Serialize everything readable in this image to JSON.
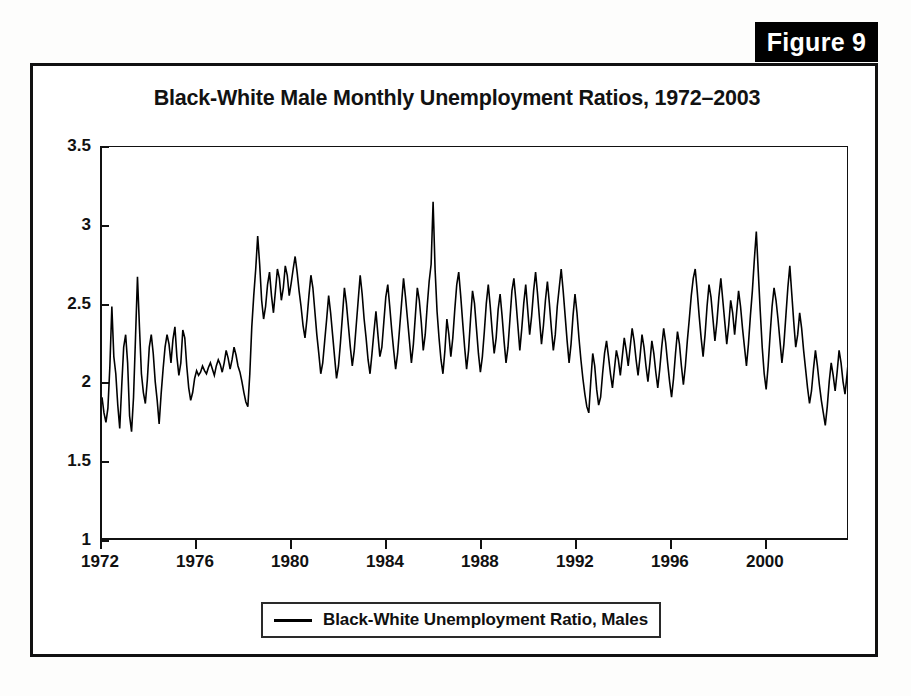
{
  "figure": {
    "tab_label": "Figure 9"
  },
  "chart_data": {
    "type": "line",
    "title": "Black-White Male Monthly Unemployment Ratios, 1972–2003",
    "xlabel": "",
    "ylabel": "",
    "xlim": [
      1972.0,
      2003.5
    ],
    "ylim": [
      1,
      3.5
    ],
    "grid": false,
    "legend_position": "below-plot",
    "y_ticks": [
      1,
      1.5,
      2,
      2.5,
      3,
      3.5
    ],
    "y_tick_labels": [
      "1",
      "1.5",
      "2",
      "2.5",
      "3",
      "3.5"
    ],
    "x_ticks": [
      1972,
      1976,
      1980,
      1984,
      1988,
      1992,
      1996,
      2000
    ],
    "x_tick_labels": [
      "1972",
      "1976",
      "1980",
      "1984",
      "1988",
      "1992",
      "1996",
      "2000"
    ],
    "series": [
      {
        "name": "Black-White Unemployment Ratio, Males",
        "color": "#000000",
        "x_start": 1972.0,
        "x_step": 0.08333,
        "values": [
          1.9,
          1.8,
          1.74,
          1.83,
          2.1,
          2.48,
          2.16,
          2.05,
          1.85,
          1.7,
          1.97,
          2.22,
          2.3,
          2.12,
          1.78,
          1.68,
          1.9,
          2.28,
          2.67,
          2.35,
          2.05,
          1.93,
          1.86,
          2.01,
          2.22,
          2.3,
          2.18,
          2.0,
          1.88,
          1.73,
          1.92,
          2.08,
          2.22,
          2.3,
          2.24,
          2.12,
          2.27,
          2.35,
          2.16,
          2.04,
          2.12,
          2.33,
          2.28,
          2.1,
          1.96,
          1.88,
          1.93,
          2.02,
          2.07,
          2.04,
          2.06,
          2.1,
          2.07,
          2.05,
          2.09,
          2.12,
          2.08,
          2.04,
          2.1,
          2.14,
          2.11,
          2.06,
          2.12,
          2.2,
          2.15,
          2.08,
          2.14,
          2.22,
          2.17,
          2.1,
          2.06,
          2.0,
          1.93,
          1.87,
          1.84,
          2.05,
          2.35,
          2.55,
          2.72,
          2.93,
          2.75,
          2.52,
          2.4,
          2.48,
          2.62,
          2.7,
          2.55,
          2.44,
          2.58,
          2.72,
          2.66,
          2.52,
          2.6,
          2.74,
          2.68,
          2.55,
          2.63,
          2.72,
          2.8,
          2.7,
          2.58,
          2.48,
          2.36,
          2.28,
          2.4,
          2.55,
          2.68,
          2.6,
          2.45,
          2.3,
          2.18,
          2.05,
          2.12,
          2.26,
          2.4,
          2.55,
          2.44,
          2.3,
          2.16,
          2.02,
          2.1,
          2.25,
          2.42,
          2.6,
          2.5,
          2.36,
          2.22,
          2.1,
          2.2,
          2.36,
          2.52,
          2.68,
          2.56,
          2.4,
          2.28,
          2.14,
          2.05,
          2.18,
          2.32,
          2.45,
          2.3,
          2.16,
          2.22,
          2.38,
          2.54,
          2.62,
          2.48,
          2.33,
          2.2,
          2.08,
          2.18,
          2.34,
          2.5,
          2.66,
          2.54,
          2.4,
          2.26,
          2.12,
          2.24,
          2.42,
          2.6,
          2.52,
          2.38,
          2.2,
          2.3,
          2.48,
          2.64,
          2.75,
          3.15,
          2.72,
          2.45,
          2.28,
          2.14,
          2.05,
          2.2,
          2.4,
          2.3,
          2.16,
          2.28,
          2.46,
          2.62,
          2.7,
          2.55,
          2.38,
          2.22,
          2.08,
          2.2,
          2.4,
          2.58,
          2.5,
          2.34,
          2.18,
          2.06,
          2.16,
          2.32,
          2.5,
          2.62,
          2.48,
          2.32,
          2.18,
          2.28,
          2.46,
          2.56,
          2.42,
          2.26,
          2.12,
          2.22,
          2.4,
          2.58,
          2.66,
          2.52,
          2.36,
          2.2,
          2.34,
          2.5,
          2.62,
          2.46,
          2.3,
          2.42,
          2.58,
          2.7,
          2.56,
          2.4,
          2.24,
          2.36,
          2.52,
          2.64,
          2.5,
          2.34,
          2.2,
          2.3,
          2.48,
          2.6,
          2.72,
          2.58,
          2.42,
          2.26,
          2.12,
          2.24,
          2.42,
          2.56,
          2.44,
          2.28,
          2.14,
          2.02,
          1.92,
          1.84,
          1.8,
          2.0,
          2.18,
          2.1,
          1.95,
          1.85,
          1.9,
          2.05,
          2.18,
          2.26,
          2.16,
          2.05,
          1.96,
          2.08,
          2.2,
          2.14,
          2.04,
          2.16,
          2.28,
          2.2,
          2.1,
          2.22,
          2.34,
          2.26,
          2.14,
          2.04,
          2.16,
          2.3,
          2.22,
          2.1,
          2.0,
          2.12,
          2.26,
          2.18,
          2.06,
          1.96,
          2.08,
          2.22,
          2.34,
          2.25,
          2.12,
          2.0,
          1.9,
          2.02,
          2.18,
          2.32,
          2.24,
          2.1,
          1.98,
          2.1,
          2.26,
          2.4,
          2.55,
          2.66,
          2.72,
          2.58,
          2.42,
          2.28,
          2.16,
          2.3,
          2.48,
          2.62,
          2.54,
          2.4,
          2.26,
          2.38,
          2.54,
          2.66,
          2.52,
          2.38,
          2.24,
          2.36,
          2.52,
          2.44,
          2.3,
          2.44,
          2.58,
          2.48,
          2.34,
          2.22,
          2.1,
          2.24,
          2.42,
          2.58,
          2.78,
          2.96,
          2.7,
          2.45,
          2.22,
          2.05,
          1.95,
          2.1,
          2.3,
          2.48,
          2.6,
          2.52,
          2.4,
          2.26,
          2.12,
          2.24,
          2.42,
          2.6,
          2.74,
          2.56,
          2.38,
          2.22,
          2.3,
          2.44,
          2.34,
          2.2,
          2.08,
          1.96,
          1.86,
          1.94,
          2.08,
          2.2,
          2.1,
          1.98,
          1.88,
          1.8,
          1.72,
          1.84,
          2.0,
          2.12,
          2.04,
          1.94,
          2.06,
          2.2,
          2.12,
          2.0,
          1.92,
          2.04,
          2.18,
          2.28,
          2.16,
          2.04,
          1.94,
          2.06,
          2.2,
          2.3,
          2.18,
          2.06,
          2.12
        ]
      }
    ]
  },
  "legend": {
    "entry_label": "Black-White Unemployment Ratio, Males"
  }
}
